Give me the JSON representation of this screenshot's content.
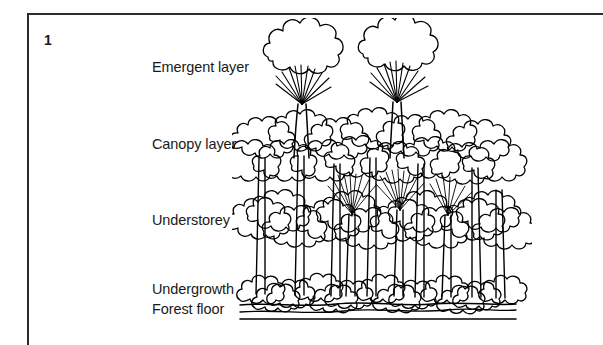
{
  "figure": {
    "number": "1",
    "caption_labels": [
      "Emergent layer",
      "Canopy layer",
      "Understorey",
      "Undergrowth",
      "Forest floor"
    ]
  },
  "labels": {
    "emergent": "Emergent layer",
    "canopy": "Canopy layer",
    "understorey": "Understorey",
    "undergrowth": "Undergrowth",
    "forest_floor": "Forest floor"
  },
  "illustration": {
    "name": "rainforest-vertical-structure-diagram",
    "style": "black-and-white line drawing",
    "ink_color": "#000000",
    "background_color": "#ffffff"
  },
  "colors": {
    "ink": "#000000",
    "frame": "#2c2c2c",
    "text": "#1a1a1a",
    "background": "#ffffff"
  }
}
